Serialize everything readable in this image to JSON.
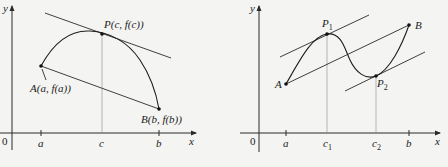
{
  "left_panel": {
    "axis_labels": {
      "y": "y",
      "x": "x",
      "origin": "0"
    },
    "ticks": [
      {
        "label": "a"
      },
      {
        "label": "c"
      },
      {
        "label": "b"
      }
    ],
    "points": {
      "A": "A(a, f(a))",
      "P": "P(c, f(c))",
      "B": "B(b, f(b))"
    }
  },
  "right_panel": {
    "axis_labels": {
      "y": "y",
      "x": "x",
      "origin": "0"
    },
    "ticks": [
      {
        "label": "a"
      },
      {
        "label": "c",
        "sub": "1"
      },
      {
        "label": "c",
        "sub": "2"
      },
      {
        "label": "b"
      }
    ],
    "points": {
      "A": "A",
      "P1": {
        "label": "P",
        "sub": "1"
      },
      "P2": {
        "label": "P",
        "sub": "2"
      },
      "B": "B"
    }
  },
  "colors": {
    "background": "#f4f4f2",
    "ink": "#222222",
    "guide": "#8a8a8a"
  }
}
